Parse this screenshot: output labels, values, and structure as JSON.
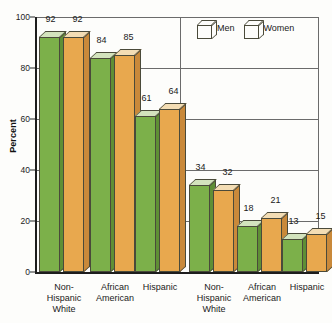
{
  "chart_data": {
    "type": "bar",
    "title": "",
    "subtitle": "",
    "xlabel": "",
    "ylabel": "Percent",
    "ylim": [
      0,
      100
    ],
    "yticks": [
      0,
      20,
      40,
      60,
      80,
      100
    ],
    "grid": true,
    "legend_position": "top-right",
    "panels": [
      {
        "name": "left-panel",
        "categories": [
          "Non-\nHispanic\nWhite",
          "African\nAmerican",
          "Hispanic"
        ],
        "series": [
          {
            "name": "Men",
            "values": [
              92,
              84,
              61
            ]
          },
          {
            "name": "Women",
            "values": [
              92,
              85,
              64
            ]
          }
        ]
      },
      {
        "name": "right-panel",
        "categories": [
          "Non-\nHispanic\nWhite",
          "African\nAmerican",
          "Hispanic"
        ],
        "series": [
          {
            "name": "Men",
            "values": [
              34,
              18,
              13
            ]
          },
          {
            "name": "Women",
            "values": [
              32,
              21,
              15
            ]
          }
        ]
      }
    ],
    "legend": [
      {
        "label": "Men",
        "color": "#7cb04a"
      },
      {
        "label": "Women",
        "color": "#e8a84e"
      }
    ],
    "colors": {
      "men_face": "#7cb04a",
      "men_side": "#5f8f35",
      "men_top": "#d3e3bd",
      "women_face": "#e8a84e",
      "women_side": "#c9893a",
      "women_top": "#f3ddb4",
      "axis": "#1d1d1d",
      "grid": "#6b6b6b",
      "background": "#fdfdfb"
    }
  },
  "axis": {
    "y_title": "Percent",
    "y_ticks": [
      "100",
      "80",
      "60",
      "40",
      "20",
      "0"
    ]
  },
  "legend": {
    "men_label": "Men",
    "women_label": "Women"
  },
  "categories": {
    "left": [
      {
        "line1": "Non-",
        "line2": "Hispanic",
        "line3": "White"
      },
      {
        "line1": "African",
        "line2": "American",
        "line3": ""
      },
      {
        "line1": "Hispanic",
        "line2": "",
        "line3": ""
      }
    ],
    "right": [
      {
        "line1": "Non-",
        "line2": "Hispanic",
        "line3": "White"
      },
      {
        "line1": "African",
        "line2": "American",
        "line3": ""
      },
      {
        "line1": "Hispanic",
        "line2": "",
        "line3": ""
      }
    ]
  },
  "values": {
    "left": {
      "men": [
        "92",
        "84",
        "61"
      ],
      "women": [
        "92",
        "85",
        "64"
      ]
    },
    "right": {
      "men": [
        "34",
        "18",
        "13"
      ],
      "women": [
        "32",
        "21",
        "15"
      ]
    }
  }
}
